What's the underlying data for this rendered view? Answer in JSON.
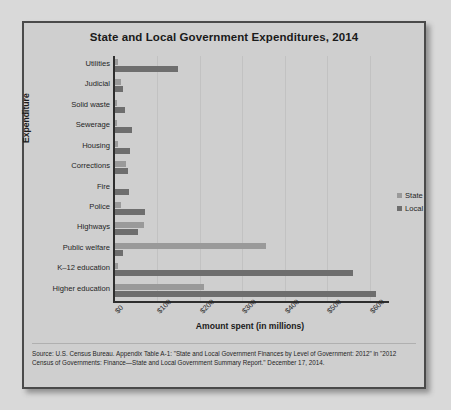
{
  "figure": {
    "title": "State and Local Government Expenditures, 2014",
    "source": "Source: U.S. Census Bureau. Appendix Table A-1: \"State and Local Government Finances by Level of Government: 2012\" in \"2012 Census of Governments: Finance—State and Local Government Summary Report.\" December 17, 2014."
  },
  "legend": {
    "items": [
      {
        "label": "State",
        "color": "#9a9a9a"
      },
      {
        "label": "Local",
        "color": "#6e6e6e"
      }
    ]
  },
  "chart_data": {
    "type": "bar",
    "orientation": "horizontal",
    "title": "State and Local Government Expenditures, 2014",
    "xlabel": "Amount spent (in millions)",
    "ylabel": "Expenditure",
    "xlim": [
      0,
      650
    ],
    "xticks": [
      0,
      100,
      200,
      300,
      400,
      500,
      600
    ],
    "xticklabels": [
      "$0",
      "$100",
      "$200",
      "$300",
      "$400",
      "$500",
      "$600"
    ],
    "grid": "vertical",
    "legend_position": "right",
    "categories": [
      "Utilities",
      "Judicial",
      "Solid waste",
      "Sewerage",
      "Housing",
      "Corrections",
      "Fire",
      "Police",
      "Highways",
      "Public welfare",
      "K–12 education",
      "Higher education"
    ],
    "series": [
      {
        "name": "State",
        "color": "#9a9a9a",
        "values": [
          8,
          14,
          2,
          3,
          8,
          25,
          0,
          15,
          68,
          355,
          8,
          210
        ]
      },
      {
        "name": "Local",
        "color": "#6e6e6e",
        "values": [
          148,
          20,
          24,
          40,
          35,
          30,
          34,
          70,
          55,
          20,
          560,
          615
        ]
      }
    ]
  }
}
